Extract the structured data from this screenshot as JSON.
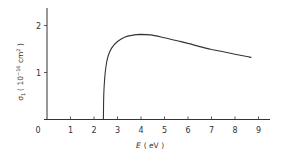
{
  "chart_data": {
    "type": "line",
    "title": "",
    "xlabel": "E ( eV )",
    "xlabel_italic": "E",
    "xlabel_unit": "( eV )",
    "ylabel": "σ1 ( 10^-16 cm^2 )",
    "ylabel_parts": {
      "sym": "σ",
      "sub": "1",
      "pre": "( 10",
      "exp1": "−16",
      "mid": " cm",
      "exp2": "2",
      "post": " )"
    },
    "xlim": [
      0,
      9.5
    ],
    "ylim": [
      0,
      2.4
    ],
    "x_ticks": [
      "0",
      "1",
      "2",
      "3",
      "4",
      "5",
      "6",
      "7",
      "8",
      "9"
    ],
    "y_ticks": [
      "1",
      "2"
    ],
    "grid": false,
    "legend": null,
    "series": [
      {
        "name": "σ1",
        "x": [
          2.4,
          2.42,
          2.5,
          2.6,
          2.75,
          3.0,
          3.3,
          3.6,
          4.0,
          4.4,
          5.0,
          5.5,
          6.0,
          6.5,
          7.0,
          7.5,
          8.0,
          8.5,
          8.7
        ],
        "values": [
          0.0,
          0.6,
          1.1,
          1.35,
          1.52,
          1.66,
          1.75,
          1.79,
          1.81,
          1.8,
          1.74,
          1.68,
          1.62,
          1.55,
          1.49,
          1.44,
          1.39,
          1.34,
          1.32
        ]
      }
    ],
    "color": "#333333"
  }
}
